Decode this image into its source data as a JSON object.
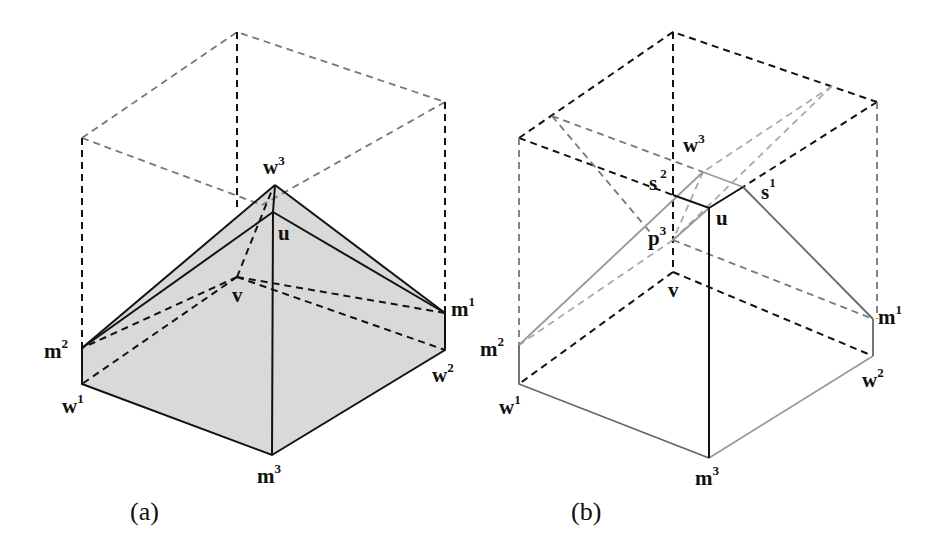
{
  "figure": {
    "panels": [
      {
        "caption": "(a)",
        "labels": {
          "w3": {
            "base": "w",
            "sup": "3"
          },
          "u": {
            "base": "u",
            "sup": ""
          },
          "v": {
            "base": "v",
            "sup": ""
          },
          "m1": {
            "base": "m",
            "sup": "1"
          },
          "m2": {
            "base": "m",
            "sup": "2"
          },
          "w1": {
            "base": "w",
            "sup": "1"
          },
          "w2": {
            "base": "w",
            "sup": "2"
          },
          "m3": {
            "base": "m",
            "sup": "3"
          }
        },
        "fill_color": "#d9d9d9"
      },
      {
        "caption": "(b)",
        "labels": {
          "w3": {
            "base": "w",
            "sup": "3"
          },
          "s2": {
            "base": "s",
            "sup": "2"
          },
          "s1": {
            "base": "s",
            "sup": "1"
          },
          "u": {
            "base": "u",
            "sup": ""
          },
          "p3": {
            "base": "p",
            "sup": "3"
          },
          "v": {
            "base": "v",
            "sup": ""
          },
          "m1": {
            "base": "m",
            "sup": "1"
          },
          "m2": {
            "base": "m",
            "sup": "2"
          },
          "w1": {
            "base": "w",
            "sup": "1"
          },
          "w2": {
            "base": "w",
            "sup": "2"
          },
          "m3": {
            "base": "m",
            "sup": "3"
          }
        }
      }
    ]
  }
}
